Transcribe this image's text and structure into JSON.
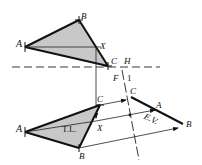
{
  "colors": {
    "stroke": "#111111",
    "fill": "#c8c8c8",
    "thin": "#222222"
  },
  "top_view": {
    "label_A": "A",
    "label_B": "B",
    "label_C": "C",
    "label_X": "X",
    "label_plane": "H",
    "points": {
      "A": [
        25,
        47
      ],
      "B": [
        79,
        20
      ],
      "C": [
        108,
        66
      ],
      "X": [
        101,
        52
      ]
    },
    "fold_line_y": 67
  },
  "front_view": {
    "label_A": "A",
    "label_B": "B",
    "label_C": "C",
    "label_X": "X",
    "label_true_length": "T.L.",
    "label_plane": "F",
    "points": {
      "A": [
        25,
        132
      ],
      "B": [
        79,
        148
      ],
      "C": [
        100,
        105
      ],
      "X": [
        96,
        121
      ]
    }
  },
  "aux_view": {
    "fold_label": "1",
    "label_C": "C",
    "label_A": "A",
    "label_B": "B",
    "label_edge_view": "E.V.",
    "points": {
      "C": [
        131,
        97
      ],
      "B": [
        183,
        124
      ]
    }
  }
}
